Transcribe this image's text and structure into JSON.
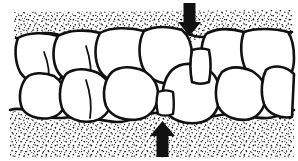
{
  "figure": {
    "background_color": "#ffffff",
    "ink_color": "#111111",
    "width": 298,
    "height": 161
  },
  "annotations": {
    "top_arrow": {
      "name": "down-arrow",
      "direction": "down",
      "color": "#111111",
      "head_left_x": 178,
      "head_right_x": 201,
      "tip_x": 189.5,
      "tip_y": 36,
      "shaft_top_y": 3,
      "shaft_left_x": 183.5,
      "shaft_right_x": 195.5,
      "shaft_bottom_y": 22
    },
    "bottom_arrow": {
      "name": "up-arrow",
      "direction": "up",
      "color": "#111111",
      "head_left_x": 150,
      "head_right_x": 175,
      "tip_x": 162.5,
      "tip_y": 121,
      "shaft_bottom_y": 157,
      "shaft_left_x": 156.5,
      "shaft_right_x": 168.5,
      "shaft_top_y": 136
    }
  },
  "regions": {
    "upper_bone": {
      "name": "upper-alveolar-bone",
      "stipple": true,
      "label": "upper bone (stippled)"
    },
    "lower_bone": {
      "name": "lower-alveolar-bone",
      "stipple": true,
      "label": "lower bone (stippled)"
    },
    "upper_arch": {
      "name": "upper-tooth-row",
      "tooth_count": 5
    },
    "lower_arch": {
      "name": "lower-tooth-row",
      "tooth_count": 5
    }
  },
  "teeth": {
    "upper": [
      {
        "id": "u1",
        "label": "upper tooth 1"
      },
      {
        "id": "u2",
        "label": "upper tooth 2"
      },
      {
        "id": "u3",
        "label": "upper tooth 3"
      },
      {
        "id": "u4",
        "label": "upper tooth 4"
      },
      {
        "id": "u5",
        "label": "upper tooth 5"
      }
    ],
    "lower": [
      {
        "id": "l1",
        "label": "lower tooth 1"
      },
      {
        "id": "l2",
        "label": "lower tooth 2"
      },
      {
        "id": "l3",
        "label": "lower tooth 3"
      },
      {
        "id": "l4",
        "label": "lower tooth 4"
      },
      {
        "id": "l5",
        "label": "lower tooth 5"
      }
    ]
  },
  "interdental_space": {
    "name": "interdental-space",
    "x": 163,
    "top_y": 48,
    "bottom_y": 112,
    "label": "space indicated by arrows"
  }
}
